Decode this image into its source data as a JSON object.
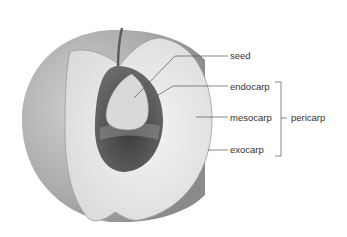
{
  "diagram": {
    "labels": {
      "seed": "seed",
      "endocarp": "endocarp",
      "mesocarp": "mesocarp",
      "exocarp": "exocarp",
      "pericarp": "pericarp"
    },
    "colors": {
      "skin": "#bdbdbd",
      "flesh": "#ececec",
      "stone": "#5a5a5a",
      "seed": "#d8d8d8",
      "line": "#555555",
      "text": "#333333"
    }
  }
}
